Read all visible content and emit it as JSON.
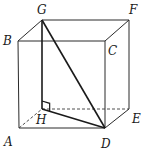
{
  "diagram": {
    "type": "cube-geometry",
    "vertices": {
      "A": {
        "label": "A",
        "x": 19,
        "y": 128,
        "lx": 4,
        "ly": 146
      },
      "B": {
        "label": "B",
        "x": 18,
        "y": 41,
        "lx": 3,
        "ly": 45
      },
      "C": {
        "label": "C",
        "x": 105,
        "y": 41,
        "lx": 108,
        "ly": 55
      },
      "D": {
        "label": "D",
        "x": 105,
        "y": 128,
        "lx": 101,
        "ly": 148
      },
      "E": {
        "label": "E",
        "x": 129,
        "y": 109,
        "lx": 132,
        "ly": 123
      },
      "F": {
        "label": "F",
        "x": 129,
        "y": 20,
        "lx": 129,
        "ly": 14
      },
      "G": {
        "label": "G",
        "x": 42,
        "y": 20,
        "lx": 37,
        "ly": 14
      },
      "H": {
        "label": "H",
        "x": 42,
        "y": 109,
        "lx": 36,
        "ly": 124
      }
    },
    "solid_edges": [
      [
        "B",
        "C"
      ],
      [
        "C",
        "F"
      ],
      [
        "G",
        "F"
      ],
      [
        "B",
        "G"
      ],
      [
        "B",
        "A"
      ],
      [
        "A",
        "D"
      ],
      [
        "C",
        "D"
      ],
      [
        "F",
        "E"
      ],
      [
        "E",
        "D"
      ]
    ],
    "bold_edges": [
      [
        "G",
        "H"
      ],
      [
        "G",
        "D"
      ],
      [
        "H",
        "D"
      ]
    ],
    "dashed_edges": [
      [
        "A",
        "H"
      ],
      [
        "H",
        "E"
      ]
    ],
    "right_angle_at": "H",
    "right_angle_between": [
      "G",
      "D"
    ]
  }
}
